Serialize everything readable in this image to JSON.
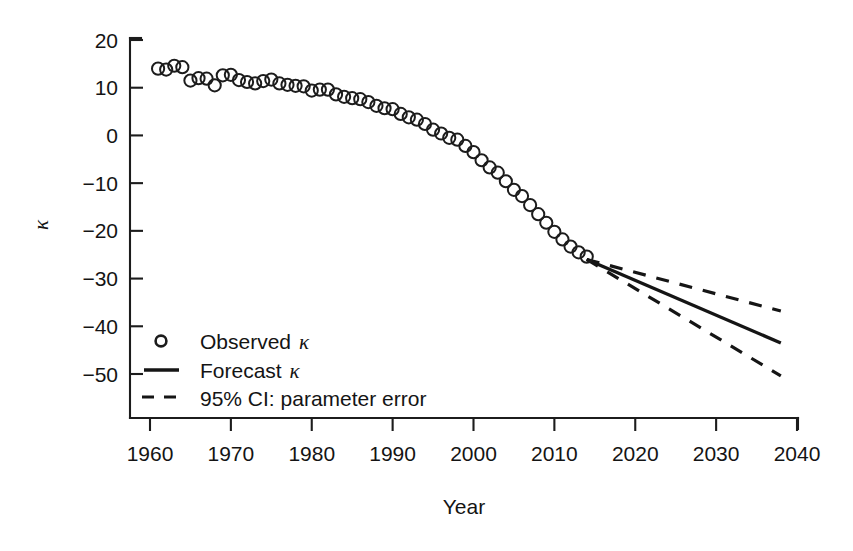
{
  "chart_data": {
    "type": "scatter",
    "title": "",
    "xlabel": "Year",
    "ylabel": "κ",
    "xlim": [
      1960,
      2040
    ],
    "ylim": [
      -50,
      20
    ],
    "xticks": [
      1960,
      1970,
      1980,
      1990,
      2000,
      2010,
      2020,
      2030,
      2040
    ],
    "xticklabels": [
      "1960",
      "1970",
      "1980",
      "1990",
      "2000",
      "2010",
      "2020",
      "2030",
      "2040"
    ],
    "yticks": [
      20,
      10,
      0,
      -10,
      -20,
      -30,
      -40,
      -50
    ],
    "yticklabels": [
      "20",
      "10",
      "0",
      "−10",
      "−20",
      "−30",
      "−40",
      "−50"
    ],
    "grid": false,
    "legend_position": "lower-left",
    "series": [
      {
        "name": "Observed κ",
        "type": "scatter",
        "marker": "open-circle",
        "x": [
          1961,
          1962,
          1963,
          1964,
          1965,
          1966,
          1967,
          1968,
          1969,
          1970,
          1971,
          1972,
          1973,
          1974,
          1975,
          1976,
          1977,
          1978,
          1979,
          1980,
          1981,
          1982,
          1983,
          1984,
          1985,
          1986,
          1987,
          1988,
          1989,
          1990,
          1991,
          1992,
          1993,
          1994,
          1995,
          1996,
          1997,
          1998,
          1999,
          2000,
          2001,
          2002,
          2003,
          2004,
          2005,
          2006,
          2007,
          2008,
          2009,
          2010,
          2011,
          2012,
          2013,
          2014
        ],
        "y": [
          14.0,
          13.8,
          14.6,
          14.3,
          11.5,
          12.0,
          11.9,
          10.5,
          12.6,
          12.7,
          11.6,
          11.2,
          10.9,
          11.4,
          11.7,
          10.9,
          10.6,
          10.4,
          10.3,
          9.4,
          9.6,
          9.6,
          8.6,
          8.1,
          7.8,
          7.6,
          7.0,
          6.2,
          5.7,
          5.5,
          4.5,
          3.8,
          3.3,
          2.4,
          1.2,
          0.4,
          -0.5,
          -0.9,
          -2.2,
          -3.5,
          -5.2,
          -6.7,
          -7.8,
          -9.6,
          -11.4,
          -12.7,
          -14.6,
          -16.5,
          -18.3,
          -20.2,
          -21.8,
          -23.3,
          -24.5,
          -25.4
        ]
      },
      {
        "name": "Forecast κ",
        "type": "line",
        "style": "solid",
        "x": [
          2014,
          2038
        ],
        "y": [
          -26.0,
          -43.5
        ]
      },
      {
        "name": "95% CI: parameter error (upper)",
        "type": "line",
        "style": "dashed",
        "x": [
          2014,
          2038
        ],
        "y": [
          -26.0,
          -36.8
        ]
      },
      {
        "name": "95% CI: parameter error (lower)",
        "type": "line",
        "style": "dashed",
        "x": [
          2014,
          2038
        ],
        "y": [
          -26.0,
          -50.4
        ]
      }
    ]
  },
  "axes": {
    "x_title": "Year",
    "y_title": "κ"
  },
  "legend": {
    "items": [
      {
        "label_prefix": "Observed ",
        "label_symbol": "κ",
        "marker": "open-circle"
      },
      {
        "label_prefix": "Forecast ",
        "label_symbol": "κ",
        "marker": "solid-line"
      },
      {
        "label_prefix": "95% CI: parameter error",
        "label_symbol": "",
        "marker": "dashed-line"
      }
    ]
  },
  "colors": {
    "ink": "#1c1c1c",
    "background": "#ffffff"
  }
}
